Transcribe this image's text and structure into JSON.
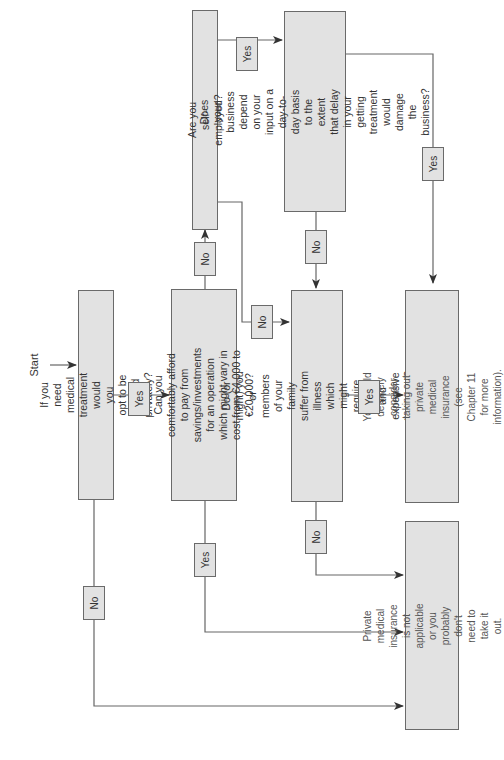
{
  "diagram": {
    "type": "flowchart",
    "orientation": "rotated-90-ccw",
    "start_label": "Start",
    "colors": {
      "box_fill": "#e2e2e2",
      "box_border": "#6a6a6a",
      "line": "#555555",
      "text": "#333333"
    },
    "nodes": {
      "q1": "If you need medical treatment would you\nopt to be treated privately?",
      "q2": "Can you comfortably afford to pay from\nsavings/investments for an operation\nwhich might vary in cost from €4,000 to\n€20,000?",
      "q3": "Are you self-employed?",
      "q4": "Does your business depend on your\ninput on a day-to-day basis to the\nextent that delay in your getting\ntreatment would damage the business?",
      "q5": "Do (or might) you or members of your\nfamily suffer from illness which might\nrequire urgent and expensive treatment?",
      "outcome_yes": "You should definitely consider taking out\nprivate medical insurance (see Chapter 11\nfor more information).",
      "outcome_no": "Private medical insurance is not applicable\nor you probably don't need to take it out."
    },
    "edges": {
      "q1_yes": "Yes",
      "q1_no": "No",
      "q2_no": "No",
      "q2_yes": "Yes",
      "q3_yes": "Yes",
      "q3_no": "No",
      "q4_yes": "Yes",
      "q4_no": "No",
      "q5_yes": "Yes",
      "q5_no": "No"
    }
  }
}
